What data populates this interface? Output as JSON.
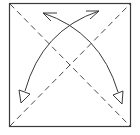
{
  "diagram": {
    "type": "origami-fold-diagram",
    "description": "Square sheet with both diagonals marked as valley folds (dashed), and two curved arrows showing bottom corners folded up to opposite top corners.",
    "colors": {
      "background": "#ffffff",
      "stroke": "#3a3a3a",
      "dash": "#4a4a4a"
    },
    "square": {
      "x": 9,
      "y": 3,
      "width": 122,
      "height": 124
    },
    "fold_lines": [
      {
        "name": "diagonal-tl-br",
        "style": "dashed",
        "from": [
          9,
          3
        ],
        "to": [
          131,
          127
        ]
      },
      {
        "name": "diagonal-bl-tr",
        "style": "dashed",
        "from": [
          9,
          127
        ],
        "to": [
          131,
          3
        ]
      }
    ],
    "arrows": [
      {
        "name": "fold-arrow-bottom-left-to-top-right",
        "from": [
          24,
          92
        ],
        "to": [
          99,
          11
        ],
        "tail": "hollow-triangle",
        "head": "open-v"
      },
      {
        "name": "fold-arrow-bottom-right-to-top-left",
        "from": [
          119,
          92
        ],
        "to": [
          43,
          13
        ],
        "tail": "hollow-triangle",
        "head": "open-v"
      }
    ]
  }
}
